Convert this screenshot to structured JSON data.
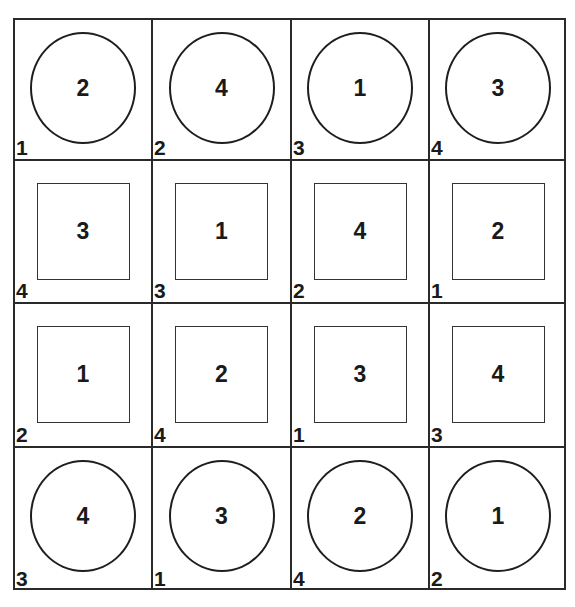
{
  "grid": {
    "rows": 4,
    "cols": 4,
    "cells": [
      [
        {
          "shape": "circle",
          "center": "2",
          "corner": "1"
        },
        {
          "shape": "circle",
          "center": "4",
          "corner": "2"
        },
        {
          "shape": "circle",
          "center": "1",
          "corner": "3"
        },
        {
          "shape": "circle",
          "center": "3",
          "corner": "4"
        }
      ],
      [
        {
          "shape": "square",
          "center": "3",
          "corner": "4"
        },
        {
          "shape": "square",
          "center": "1",
          "corner": "3"
        },
        {
          "shape": "square",
          "center": "4",
          "corner": "2"
        },
        {
          "shape": "square",
          "center": "2",
          "corner": "1"
        }
      ],
      [
        {
          "shape": "square",
          "center": "1",
          "corner": "2"
        },
        {
          "shape": "square",
          "center": "2",
          "corner": "4"
        },
        {
          "shape": "square",
          "center": "3",
          "corner": "1"
        },
        {
          "shape": "square",
          "center": "4",
          "corner": "3"
        }
      ],
      [
        {
          "shape": "circle",
          "center": "4",
          "corner": "3"
        },
        {
          "shape": "circle",
          "center": "3",
          "corner": "1"
        },
        {
          "shape": "circle",
          "center": "2",
          "corner": "4"
        },
        {
          "shape": "circle",
          "center": "1",
          "corner": "2"
        }
      ]
    ]
  }
}
